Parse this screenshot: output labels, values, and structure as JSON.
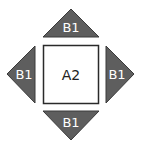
{
  "diagram": {
    "center": {
      "label": "A2",
      "shape": "square"
    },
    "arrows": [
      {
        "position": "top",
        "label": "B1",
        "direction": "up"
      },
      {
        "position": "left",
        "label": "B1",
        "direction": "left"
      },
      {
        "position": "right",
        "label": "B1",
        "direction": "right"
      },
      {
        "position": "bottom",
        "label": "B1",
        "direction": "down"
      }
    ],
    "colors": {
      "triangle_fill": "#5e5e5e",
      "triangle_stroke": "#3a3a3a",
      "square_stroke": "#2a2a2a",
      "background": "#ffffff"
    }
  }
}
